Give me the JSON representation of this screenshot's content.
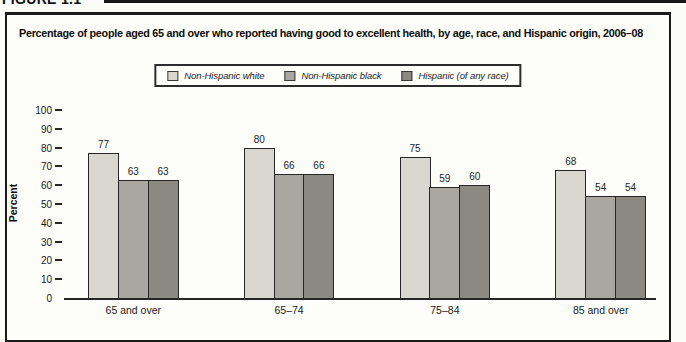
{
  "figure_label": "FIGURE 1.1",
  "title": "Percentage of people aged 65 and over who reported having good to excellent health, by age, race, and Hispanic origin, 2006–08",
  "legend": [
    {
      "label": "Non-Hispanic white",
      "color": "#d9d8d0"
    },
    {
      "label": "Non-Hispanic black",
      "color": "#a9a8a0"
    },
    {
      "label": "Hispanic (of any race)",
      "color": "#8b8a82"
    }
  ],
  "chart_data": {
    "type": "bar",
    "title": "Percentage of people aged 65 and over who reported having good to excellent health, by age, race, and Hispanic origin, 2006–08",
    "categories": [
      "65 and over",
      "65–74",
      "75–84",
      "85 and over"
    ],
    "series": [
      {
        "name": "Non-Hispanic white",
        "color": "#d9d8d0",
        "values": [
          77,
          80,
          75,
          68
        ]
      },
      {
        "name": "Non-Hispanic black",
        "color": "#a9a8a0",
        "values": [
          63,
          66,
          59,
          54
        ]
      },
      {
        "name": "Hispanic (of any race)",
        "color": "#8b8a82",
        "values": [
          63,
          66,
          60,
          54
        ]
      }
    ],
    "xlabel": "",
    "ylabel": "Percent",
    "ylim": [
      0,
      100
    ],
    "yticks": [
      0,
      10,
      20,
      30,
      40,
      50,
      60,
      70,
      80,
      90,
      100
    ],
    "grid": false,
    "legend_position": "top-center",
    "bar_value_labels": true
  }
}
